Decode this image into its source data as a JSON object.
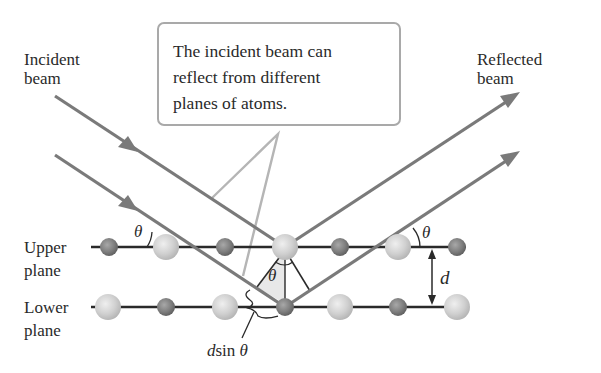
{
  "diagram": {
    "labels": {
      "incident_beam": [
        "Incident",
        "beam"
      ],
      "reflected_beam": [
        "Reflected",
        "beam"
      ],
      "upper_plane": [
        "Upper",
        "plane"
      ],
      "lower_plane": [
        "Lower",
        "plane"
      ],
      "path_difference_d": "d",
      "path_difference_sin": "sin",
      "path_difference_theta": "θ",
      "plane_spacing": "d",
      "angle_symbol": "θ"
    },
    "callout": {
      "lines": [
        "The incident beam can",
        "reflect from different",
        "planes of atoms."
      ]
    },
    "planes": [
      {
        "name": "upper",
        "atoms": [
          "small",
          "large",
          "small",
          "large",
          "small",
          "large",
          "small"
        ]
      },
      {
        "name": "lower",
        "atoms": [
          "large",
          "small",
          "large",
          "small",
          "large",
          "small",
          "large"
        ]
      }
    ],
    "colors": {
      "beam": "#7a7a7a",
      "plane_line": "#2a2a2a",
      "callout_border": "#a9a9a9",
      "callout_pointer": "#b5b5b5",
      "small_atom": "#8a8a8a",
      "large_atom": "#d2d2d2",
      "triangle_fill": "#e6e6e6"
    }
  }
}
